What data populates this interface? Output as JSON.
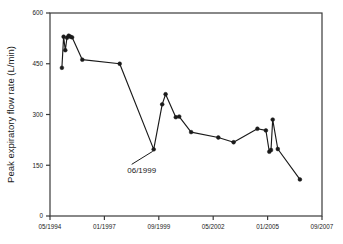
{
  "chart_data": {
    "type": "line",
    "title": "",
    "xlabel": "",
    "ylabel": "Peak expiratory flow rate (L/min)",
    "grid": false,
    "legend": "none",
    "xlim": [
      "05/1994",
      "09/2007"
    ],
    "ylim": [
      0,
      600
    ],
    "yticks": [
      "0",
      "150",
      "300",
      "450",
      "600"
    ],
    "ytick_values": [
      0,
      150,
      300,
      450,
      600
    ],
    "xticks": [
      "05/1994",
      "01/1997",
      "09/1999",
      "05/2002",
      "01/2005",
      "09/2007"
    ],
    "xtick_months": [
      0,
      32,
      64,
      96,
      128,
      160
    ],
    "annotations": [
      {
        "label": "06/1999",
        "point_month": 61,
        "point_value": 197
      }
    ],
    "series": [
      {
        "name": "Peak expiratory flow rate",
        "marker": "filled-circle",
        "color": "#1a1a1a",
        "x_months": [
          7,
          8,
          9,
          10,
          11,
          12,
          13,
          19,
          41,
          61,
          66,
          68,
          74,
          76,
          83,
          99,
          108,
          122,
          127,
          129,
          130,
          131,
          134,
          147
        ],
        "x_labels": [
          "12/1994",
          "01/1995",
          "02/1995",
          "03/1995",
          "04/1995",
          "05/1995",
          "06/1995",
          "12/1995",
          "10/1997",
          "06/1999",
          "11/1999",
          "01/2000",
          "07/2000",
          "09/2000",
          "04/2001",
          "08/2002",
          "05/2003",
          "07/2004",
          "12/2004",
          "02/2005",
          "03/2005",
          "04/2005",
          "07/2005",
          "08/2006"
        ],
        "values": [
          438,
          530,
          490,
          527,
          533,
          530,
          528,
          462,
          450,
          197,
          330,
          360,
          292,
          294,
          248,
          232,
          218,
          258,
          253,
          190,
          195,
          285,
          198,
          108
        ]
      }
    ]
  },
  "axis": {
    "ylabel": "Peak expiratory flow rate (L/min)"
  }
}
